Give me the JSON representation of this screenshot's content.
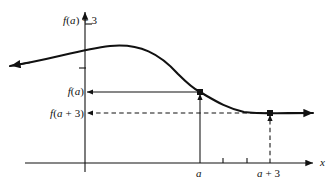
{
  "figure": {
    "background_color": "#ffffff",
    "curve_color": "#111111",
    "axis_color": "#111111"
  },
  "labels": {
    "y_top": "f(a) + 3",
    "y_fa": "f(a)",
    "y_fa_plus_3": "f(a + 3)",
    "x_a": "a",
    "x_a_plus_3": "a + 3",
    "x_axis": "x"
  },
  "chart_data": {
    "type": "line",
    "title": "",
    "xlabel": "x",
    "ylabel": "",
    "grid": false,
    "legend": null,
    "axis": {
      "x_axis_y_pixel": 163,
      "y_axis_x_pixel": 85,
      "x_arrow_end": 313,
      "y_arrow_end": 10,
      "curve_left_arrow_end": 10
    },
    "x_ticks": [
      {
        "label": "a",
        "x": 200,
        "type": "major"
      },
      {
        "label": "",
        "x": 223,
        "type": "minor"
      },
      {
        "label": "",
        "x": 247,
        "type": "minor"
      },
      {
        "label": "a + 3",
        "x": 270,
        "type": "major"
      }
    ],
    "y_ticks": [
      {
        "label": "f(a) + 3",
        "y": 24
      },
      {
        "label": "",
        "y": 68
      },
      {
        "label": "f(a)",
        "y": 92
      },
      {
        "label": "f(a + 3)",
        "y": 113
      }
    ],
    "points": [
      {
        "name": "point-at-a",
        "x": 200,
        "y": 92,
        "label": "f(a)",
        "marker": "filled-square"
      },
      {
        "name": "point-at-a-plus-3",
        "x": 270,
        "y": 113,
        "label": "f(a + 3)",
        "marker": "filled-square"
      }
    ],
    "curve": "M 10 66 C 50 60, 78 50, 110 46 C 140 43, 160 54, 178 74 C 190 86, 196 90, 200 92 C 214 100, 226 108, 244 112 C 258 114, 280 113, 313 113",
    "annotations": [
      {
        "name": "fa-horizontal-arrow",
        "style": "solid",
        "from_x": 200,
        "to_x": 85,
        "y": 92
      },
      {
        "name": "fa-vertical-arrow",
        "style": "solid",
        "from_y": 163,
        "to_y": 92,
        "x": 200
      },
      {
        "name": "fa3-horizontal-arrow",
        "style": "dashed",
        "from_x": 270,
        "to_x": 85,
        "y": 113
      },
      {
        "name": "fa3-vertical-arrow",
        "style": "dashed",
        "from_y": 163,
        "to_y": 113,
        "x": 270
      }
    ]
  }
}
